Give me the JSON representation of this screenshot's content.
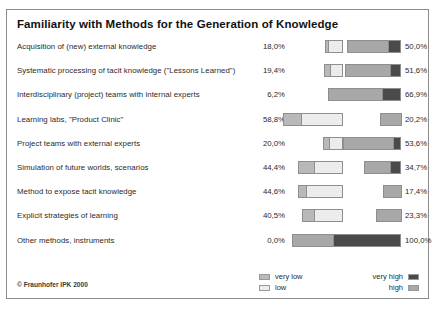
{
  "figure": {
    "title": "Familiarity with Methods for the Generation of Knowledge",
    "footer": "© Fraunhofer IPK 2000"
  },
  "legend": {
    "left": [
      {
        "label": "very low",
        "swatch": "#b9b9b9"
      },
      {
        "label": "low",
        "swatch": "#ececec"
      }
    ],
    "right": [
      {
        "label": "very high",
        "swatch": "#4a4a4a"
      },
      {
        "label": "high",
        "swatch": "#a8a8a8"
      }
    ]
  },
  "chart_data": {
    "type": "bar",
    "subtype": "diverging-stacked-bar",
    "title": "Familiarity with Methods for the Generation of Knowledge",
    "xlabel": "",
    "ylabel": "",
    "grid": false,
    "legend_position": "bottom",
    "series": [
      {
        "name": "very low",
        "color": "#b9b9b9",
        "side": "left"
      },
      {
        "name": "low",
        "color": "#ececec",
        "side": "left"
      },
      {
        "name": "high",
        "color": "#a8a8a8",
        "side": "right"
      },
      {
        "name": "very high",
        "color": "#4a4a4a",
        "side": "right"
      }
    ],
    "categories": [
      "Acquisition of (new) external knowledge",
      "Systematic processing of tacit knowledge (\"Lessons Learned\")",
      "Interdisciplinary (project) teams with internal experts",
      "Learning labs, \"Product Clinic\"",
      "Project teams with external experts",
      "Simulation of future worlds, scenarios",
      "Method to expose tacit knowledge",
      "Explicit strategies of learning",
      "Other methods, instruments"
    ],
    "left_totals": [
      18.0,
      19.4,
      6.2,
      58.8,
      20.0,
      44.4,
      44.6,
      40.5,
      0.0
    ],
    "right_totals": [
      50.0,
      51.6,
      66.9,
      20.2,
      53.6,
      34.7,
      17.4,
      23.3,
      100.0
    ],
    "left_labels": [
      "18,0%",
      "19,4%",
      "6,2%",
      "58,8%",
      "20,0%",
      "44,4%",
      "44,6%",
      "40,5%",
      "0,0%"
    ],
    "right_labels": [
      "50,0%",
      "51,6%",
      "66,9%",
      "20,2%",
      "53,6%",
      "34,7%",
      "17,4%",
      "23,3%",
      "100,0%"
    ],
    "rows": [
      {
        "category": "Acquisition of (new) external knowledge",
        "left_label": "18,0%",
        "right_label": "50,0%",
        "very_low": 3.6,
        "low": 14.4,
        "high": 38.0,
        "very_high": 12.0
      },
      {
        "category": "Systematic processing of tacit knowledge (\"Lessons Learned\")",
        "left_label": "19,4%",
        "right_label": "51,6%",
        "very_low": 6.5,
        "low": 12.9,
        "high": 41.9,
        "very_high": 9.7
      },
      {
        "category": "Interdisciplinary (project) teams with internal experts",
        "left_label": "6,2%",
        "right_label": "66,9%",
        "very_low": 0.0,
        "low": 6.2,
        "high": 50.0,
        "very_high": 16.9
      },
      {
        "category": "Learning labs, \"Product Clinic\"",
        "left_label": "58,8%",
        "right_label": "20,2%",
        "very_low": 17.6,
        "low": 41.2,
        "high": 20.2,
        "very_high": 0.0
      },
      {
        "category": "Project teams with external experts",
        "left_label": "20,0%",
        "right_label": "53,6%",
        "very_low": 6.4,
        "low": 13.6,
        "high": 46.4,
        "very_high": 7.2
      },
      {
        "category": "Simulation of future worlds, scenarios",
        "left_label": "44,4%",
        "right_label": "34,7%",
        "very_low": 16.7,
        "low": 27.7,
        "high": 25.0,
        "very_high": 9.7
      },
      {
        "category": "Method to expose tacit knowledge",
        "left_label": "44,6%",
        "right_label": "17,4%",
        "very_low": 8.9,
        "low": 35.7,
        "high": 17.4,
        "very_high": 0.0
      },
      {
        "category": "Explicit strategies of learning",
        "left_label": "40,5%",
        "right_label": "23,3%",
        "very_low": 11.9,
        "low": 28.6,
        "high": 23.3,
        "very_high": 0.0
      },
      {
        "category": "Other methods, instruments",
        "left_label": "0,0%",
        "right_label": "100,0%",
        "very_low": 0.0,
        "low": 0.0,
        "high": 38.0,
        "very_high": 62.0
      }
    ]
  },
  "scale": {
    "left_anchor_x": 337,
    "right_anchor_x": 395,
    "px_per_percent_left": 1.03,
    "px_per_percent_right": 1.1
  }
}
